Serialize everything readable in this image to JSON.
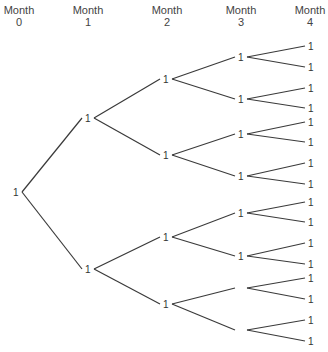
{
  "headers": [
    {
      "line1": "Month",
      "line2": "0",
      "x": 19
    },
    {
      "line1": "Month",
      "line2": "1",
      "x": 88
    },
    {
      "line1": "Month",
      "line2": "2",
      "x": 167
    },
    {
      "line1": "Month",
      "line2": "3",
      "x": 241
    },
    {
      "line1": "Month",
      "line2": "4",
      "x": 310
    }
  ],
  "nodes": {
    "month0": [
      {
        "label": "1",
        "x": 16,
        "y": 192
      }
    ],
    "month1": [
      {
        "label": "1",
        "x": 88,
        "y": 118
      },
      {
        "label": "1",
        "x": 88,
        "y": 269
      }
    ],
    "month2": [
      {
        "label": "1",
        "x": 166,
        "y": 79
      },
      {
        "label": "1",
        "x": 166,
        "y": 155
      },
      {
        "label": "1",
        "x": 166,
        "y": 237
      },
      {
        "label": "1",
        "x": 166,
        "y": 304
      }
    ],
    "month3": [
      {
        "label": "1",
        "x": 241,
        "y": 57
      },
      {
        "label": "1",
        "x": 241,
        "y": 99
      },
      {
        "label": "1",
        "x": 241,
        "y": 134
      },
      {
        "label": "1",
        "x": 241,
        "y": 176
      },
      {
        "label": "1",
        "x": 241,
        "y": 213
      },
      {
        "label": "1",
        "x": 241,
        "y": 256
      },
      {
        "label": "",
        "x": 241,
        "y": 288
      },
      {
        "label": "",
        "x": 241,
        "y": 330
      }
    ],
    "month4": [
      {
        "label": "1",
        "x": 311,
        "y": 46
      },
      {
        "label": "1",
        "x": 311,
        "y": 67
      },
      {
        "label": "1",
        "x": 311,
        "y": 88
      },
      {
        "label": "1",
        "x": 311,
        "y": 108
      },
      {
        "label": "1",
        "x": 311,
        "y": 122
      },
      {
        "label": "1",
        "x": 311,
        "y": 142
      },
      {
        "label": "1",
        "x": 311,
        "y": 163
      },
      {
        "label": "1",
        "x": 311,
        "y": 184
      },
      {
        "label": "1",
        "x": 311,
        "y": 202
      },
      {
        "label": "1",
        "x": 311,
        "y": 222
      },
      {
        "label": "1",
        "x": 311,
        "y": 243
      },
      {
        "label": "1",
        "x": 311,
        "y": 264
      },
      {
        "label": "1",
        "x": 311,
        "y": 278
      },
      {
        "label": "1",
        "x": 311,
        "y": 299
      },
      {
        "label": "1",
        "x": 311,
        "y": 320
      },
      {
        "label": "1",
        "x": 311,
        "y": 341
      }
    ]
  }
}
